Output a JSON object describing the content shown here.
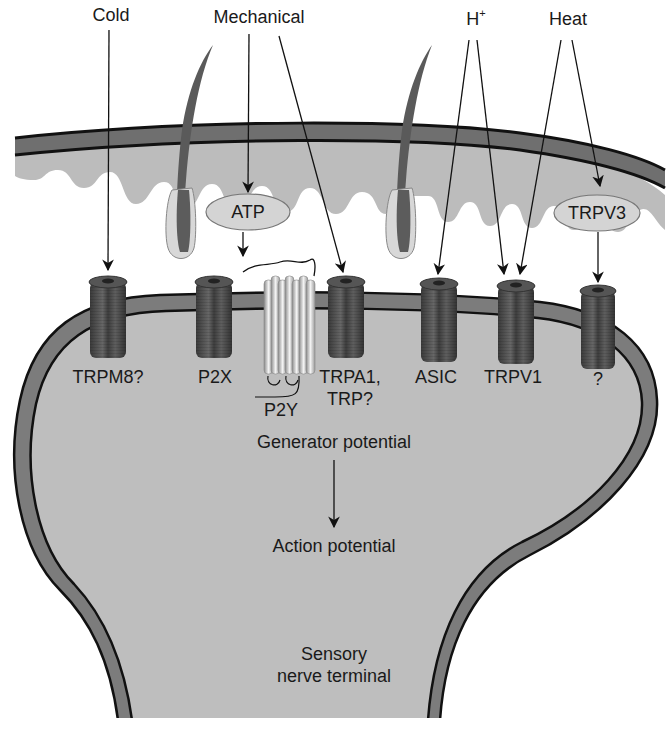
{
  "figure": {
    "type": "diagram"
  },
  "stimuli": [
    {
      "id": "cold",
      "label": "Cold"
    },
    {
      "id": "mechanical",
      "label": "Mechanical"
    },
    {
      "id": "protons",
      "label": "H",
      "superscript": "+"
    },
    {
      "id": "heat",
      "label": "Heat"
    }
  ],
  "mediators": [
    {
      "id": "atp",
      "label": "ATP"
    },
    {
      "id": "trpv3",
      "label": "TRPV3"
    }
  ],
  "channels": [
    {
      "id": "trpm8",
      "label": "TRPM8?",
      "activated_by": [
        "cold"
      ]
    },
    {
      "id": "p2x",
      "label": "P2X",
      "activated_by": [
        "atp"
      ]
    },
    {
      "id": "p2y",
      "label": "P2Y",
      "activated_by": [
        "atp"
      ],
      "kind": "GPCR"
    },
    {
      "id": "trpa1",
      "label_line1": "TRPA1,",
      "label_line2": "TRP?",
      "activated_by": [
        "mechanical"
      ]
    },
    {
      "id": "asic",
      "label": "ASIC",
      "activated_by": [
        "protons"
      ]
    },
    {
      "id": "trpv1",
      "label": "TRPV1",
      "activated_by": [
        "protons",
        "heat"
      ]
    },
    {
      "id": "unknown",
      "label": "?",
      "activated_by": [
        "trpv3"
      ]
    }
  ],
  "flow": {
    "step1": "Generator potential",
    "step2": "Action potential"
  },
  "terminal": {
    "line1": "Sensory",
    "line2": "nerve terminal"
  },
  "colors": {
    "epidermis_band": "#6e6e6e",
    "dermis": "#b9b9b9",
    "terminal_fill": "#bdbdbd",
    "membrane": "#7a7a7a",
    "channel": "#4a4a4a",
    "pill_fill": "#d6d6d6",
    "line": "#1a1a1a"
  }
}
